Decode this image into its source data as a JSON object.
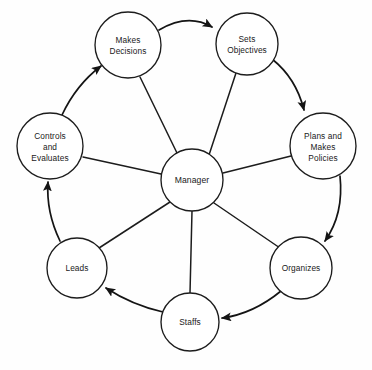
{
  "diagram": {
    "type": "cycle-hub-and-spoke",
    "background_color": "#ffffff",
    "stroke_color": "#1c1c1c",
    "text_color": "#1a1a1a",
    "center": {
      "id": "manager",
      "label": "Manager",
      "lines": [
        "Manager"
      ],
      "cx": 192,
      "cy": 180,
      "r": 31
    },
    "nodes": [
      {
        "id": "makes-decisions",
        "label": "Makes Decisions",
        "lines": [
          "Makes",
          "Decisions"
        ],
        "cx": 128,
        "cy": 45,
        "r": 33
      },
      {
        "id": "sets-objectives",
        "label": "Sets Objectives",
        "lines": [
          "Sets",
          "Objectives"
        ],
        "cx": 247,
        "cy": 44,
        "r": 31
      },
      {
        "id": "plans-and-makes-policies",
        "label": "Plans and Makes Policies",
        "lines": [
          "Plans and",
          "Makes",
          "Policies"
        ],
        "cx": 323,
        "cy": 146,
        "r": 33
      },
      {
        "id": "organizes",
        "label": "Organizes",
        "lines": [
          "Organizes"
        ],
        "cx": 301,
        "cy": 268,
        "r": 31
      },
      {
        "id": "staffs",
        "label": "Staffs",
        "lines": [
          "Staffs"
        ],
        "cx": 190,
        "cy": 322,
        "r": 29
      },
      {
        "id": "leads",
        "label": "Leads",
        "lines": [
          "Leads"
        ],
        "cx": 77,
        "cy": 268,
        "r": 30
      },
      {
        "id": "controls-and-evaluates",
        "label": "Controls and Evaluates",
        "lines": [
          "Controls",
          "and",
          "Evaluates"
        ],
        "cx": 50,
        "cy": 146,
        "r": 33
      }
    ],
    "cycle_edges": [
      {
        "id": "edge-makes-decisions-to-sets-objectives",
        "from": "makes-decisions",
        "to": "sets-objectives",
        "arrow": true
      },
      {
        "id": "edge-sets-objectives-to-plans",
        "from": "sets-objectives",
        "to": "plans-and-makes-policies",
        "arrow": true
      },
      {
        "id": "edge-plans-to-organizes",
        "from": "plans-and-makes-policies",
        "to": "organizes",
        "arrow": true
      },
      {
        "id": "edge-organizes-to-staffs",
        "from": "organizes",
        "to": "staffs",
        "arrow": true
      },
      {
        "id": "edge-staffs-to-leads",
        "from": "staffs",
        "to": "leads",
        "arrow": true
      },
      {
        "id": "edge-leads-to-controls",
        "from": "leads",
        "to": "controls-and-evaluates",
        "arrow": true
      },
      {
        "id": "edge-controls-to-makes-decisions",
        "from": "controls-and-evaluates",
        "to": "makes-decisions",
        "arrow": true
      }
    ],
    "spokes": [
      {
        "id": "spoke-manager-makes-decisions",
        "from": "manager",
        "to": "makes-decisions",
        "arrow": false
      },
      {
        "id": "spoke-manager-sets-objectives",
        "from": "manager",
        "to": "sets-objectives",
        "arrow": false
      },
      {
        "id": "spoke-manager-plans",
        "from": "manager",
        "to": "plans-and-makes-policies",
        "arrow": false
      },
      {
        "id": "spoke-manager-organizes",
        "from": "manager",
        "to": "organizes",
        "arrow": false
      },
      {
        "id": "spoke-manager-staffs",
        "from": "manager",
        "to": "staffs",
        "arrow": false
      },
      {
        "id": "spoke-manager-leads",
        "from": "manager",
        "to": "leads",
        "arrow": false
      },
      {
        "id": "spoke-manager-controls",
        "from": "manager",
        "to": "controls-and-evaluates",
        "arrow": false
      }
    ]
  }
}
